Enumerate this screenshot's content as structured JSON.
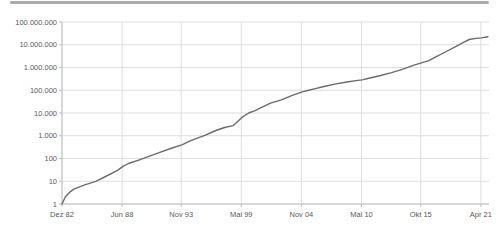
{
  "page": {
    "background_color": "#ffffff",
    "top_rule_color": "#aaaaaa"
  },
  "chart_data": {
    "type": "line",
    "title": "",
    "xlabel": "",
    "ylabel": "",
    "y_scale": "log",
    "ylim": [
      1,
      100000000
    ],
    "grid": true,
    "legend": "none",
    "colors": {
      "line": "#6b6b6b",
      "grid": "#dedede",
      "axis": "#bfbfbf",
      "tick": "#bfbfbf",
      "label": "#595959"
    },
    "y_ticks": [
      {
        "label": "1",
        "value": 1
      },
      {
        "label": "10",
        "value": 10
      },
      {
        "label": "100",
        "value": 100
      },
      {
        "label": "1.000",
        "value": 1000
      },
      {
        "label": "10.000",
        "value": 10000
      },
      {
        "label": "100.000",
        "value": 100000
      },
      {
        "label": "1.000.000",
        "value": 1000000
      },
      {
        "label": "10.000.000",
        "value": 10000000
      },
      {
        "label": "100.000.000",
        "value": 100000000
      }
    ],
    "x_ticks": [
      {
        "label": "Dez 82",
        "year": 1982.92
      },
      {
        "label": "Jun 88",
        "year": 1988.42
      },
      {
        "label": "Nov 93",
        "year": 1993.83
      },
      {
        "label": "Mai 99",
        "year": 1999.33
      },
      {
        "label": "Nov 04",
        "year": 2004.83
      },
      {
        "label": "Mai 10",
        "year": 2010.33
      },
      {
        "label": "Okt 15",
        "year": 2015.75
      },
      {
        "label": "Apr 21",
        "year": 2021.25
      }
    ],
    "x_range_years": [
      1982.92,
      2022.0
    ],
    "series": [
      {
        "name": "count",
        "points": [
          [
            1982.92,
            1
          ],
          [
            1983.2,
            2
          ],
          [
            1983.6,
            3.2
          ],
          [
            1984,
            4.5
          ],
          [
            1985,
            7
          ],
          [
            1986,
            10
          ],
          [
            1987,
            17
          ],
          [
            1988,
            30
          ],
          [
            1988.5,
            45
          ],
          [
            1989,
            60
          ],
          [
            1990,
            87
          ],
          [
            1991,
            130
          ],
          [
            1992,
            195
          ],
          [
            1993,
            290
          ],
          [
            1993.9,
            400
          ],
          [
            1994.5,
            550
          ],
          [
            1995,
            700
          ],
          [
            1996,
            1050
          ],
          [
            1997,
            1700
          ],
          [
            1997.8,
            2300
          ],
          [
            1998.6,
            2800
          ],
          [
            1999.0,
            4200
          ],
          [
            1999.4,
            6500
          ],
          [
            2000,
            10000
          ],
          [
            2000.6,
            12800
          ],
          [
            2001,
            16000
          ],
          [
            2002,
            27000
          ],
          [
            2003,
            38000
          ],
          [
            2004,
            60000
          ],
          [
            2004.9,
            85000
          ],
          [
            2005.5,
            100000
          ],
          [
            2006,
            115000
          ],
          [
            2007,
            150000
          ],
          [
            2008,
            190000
          ],
          [
            2009,
            230000
          ],
          [
            2010,
            270000
          ],
          [
            2010.4,
            285000
          ],
          [
            2011,
            340000
          ],
          [
            2012,
            430000
          ],
          [
            2013,
            580000
          ],
          [
            2014,
            800000
          ],
          [
            2015,
            1200000
          ],
          [
            2015.8,
            1600000
          ],
          [
            2016.5,
            2000000
          ],
          [
            2017,
            2700000
          ],
          [
            2018,
            4800000
          ],
          [
            2019,
            8500000
          ],
          [
            2019.7,
            13000000
          ],
          [
            2020.2,
            17000000
          ],
          [
            2020.8,
            19000000
          ],
          [
            2021.3,
            20000000
          ],
          [
            2021.9,
            22500000
          ]
        ]
      }
    ]
  }
}
